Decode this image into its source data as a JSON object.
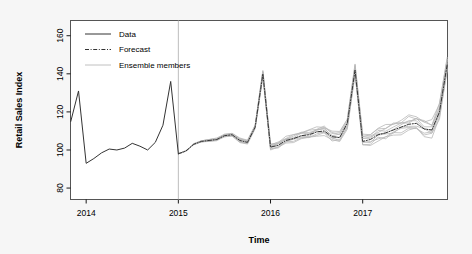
{
  "chart_data": {
    "type": "line",
    "title": "",
    "xlabel": "Time",
    "ylabel": "Retail Sales Index",
    "xlim": [
      2013.83,
      2017.92
    ],
    "ylim": [
      74,
      168
    ],
    "grid": false,
    "legend_position": "top-left",
    "y_ticks": [
      80,
      100,
      120,
      140,
      160
    ],
    "y_tick_labels": [
      "80",
      "100",
      "120",
      "140",
      "160"
    ],
    "x_ticks": [
      2014,
      2015,
      2016,
      2017
    ],
    "x_tick_labels": [
      "2014",
      "2015",
      "2016",
      "2017"
    ],
    "legend": [
      {
        "label": "Data",
        "style": "solid",
        "color": "#333333"
      },
      {
        "label": "Forecast",
        "style": "dash-dot",
        "color": "#333333"
      },
      {
        "label": "Ensemble members",
        "style": "solid",
        "color": "#c0c0c0"
      }
    ],
    "annotations": [
      {
        "type": "vline",
        "x": 2015.0,
        "color": "#bdbdbd",
        "note": "forecast origin separating observed data from forecast"
      }
    ],
    "series": [
      {
        "name": "Data",
        "style": "solid",
        "color": "#333333",
        "x": [
          2013.833,
          2013.917,
          2014.0,
          2014.083,
          2014.167,
          2014.25,
          2014.333,
          2014.417,
          2014.5,
          2014.583,
          2014.667,
          2014.75,
          2014.833,
          2014.917,
          2015.0
        ],
        "values": [
          115.0,
          131.0,
          93.0,
          95.5,
          98.5,
          100.5,
          100.0,
          101.0,
          103.5,
          102.0,
          100.0,
          104.0,
          113.0,
          136.0,
          98.0
        ]
      },
      {
        "name": "Forecast",
        "style": "dash-dot",
        "color": "#333333",
        "x": [
          2015.0,
          2015.083,
          2015.167,
          2015.25,
          2015.333,
          2015.417,
          2015.5,
          2015.583,
          2015.667,
          2015.75,
          2015.833,
          2015.917,
          2016.0,
          2016.083,
          2016.167,
          2016.25,
          2016.333,
          2016.417,
          2016.5,
          2016.583,
          2016.667,
          2016.75,
          2016.833,
          2016.917,
          2017.0,
          2017.083,
          2017.167,
          2017.25,
          2017.333,
          2017.417,
          2017.5,
          2017.583,
          2017.667,
          2017.75,
          2017.833,
          2017.917
        ],
        "values": [
          98.0,
          99.5,
          103.0,
          104.5,
          105.0,
          105.5,
          107.5,
          108.0,
          105.0,
          104.0,
          112.0,
          140.0,
          101.5,
          102.5,
          105.0,
          106.0,
          107.5,
          108.0,
          109.5,
          110.0,
          107.0,
          106.5,
          114.0,
          142.0,
          104.5,
          105.5,
          108.0,
          109.0,
          110.5,
          112.0,
          113.5,
          114.0,
          111.0,
          110.5,
          120.0,
          145.0
        ]
      }
    ]
  }
}
